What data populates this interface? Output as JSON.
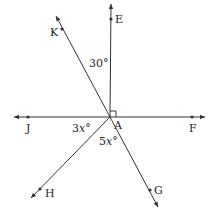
{
  "diagram": {
    "type": "geometry-angles",
    "vertex": {
      "label": "A",
      "x": 110,
      "y": 117
    },
    "rays": [
      {
        "name": "ray-AE",
        "end": [
          111,
          4
        ],
        "point": {
          "label": "E",
          "x": 111,
          "y": 19,
          "lx": 115,
          "ly": 23
        }
      },
      {
        "name": "ray-AK",
        "end": [
          56,
          16
        ],
        "point": {
          "label": "K",
          "x": 62,
          "y": 29,
          "lx": 50,
          "ly": 36
        }
      },
      {
        "name": "ray-AJ",
        "end": [
          14,
          117
        ],
        "point": {
          "label": "J",
          "x": 28,
          "y": 117,
          "lx": 26,
          "ly": 132
        }
      },
      {
        "name": "ray-AF",
        "end": [
          205,
          117
        ],
        "point": {
          "label": "F",
          "x": 192,
          "y": 117,
          "lx": 189,
          "ly": 132
        }
      },
      {
        "name": "ray-AH",
        "end": [
          31,
          198
        ],
        "point": {
          "label": "H",
          "x": 40,
          "y": 189,
          "lx": 45,
          "ly": 197
        }
      },
      {
        "name": "ray-AG",
        "end": [
          158,
          207
        ],
        "point": {
          "label": "G",
          "x": 150,
          "y": 190,
          "lx": 154,
          "ly": 194
        }
      }
    ],
    "angle_labels": [
      {
        "name": "angle-KAE",
        "text": "30°",
        "x": 89,
        "y": 67
      },
      {
        "name": "angle-JAH",
        "text": "3x°",
        "x": 72,
        "y": 132
      },
      {
        "name": "angle-HAG",
        "text": "5x°",
        "x": 99,
        "y": 145
      }
    ],
    "vertex_label": {
      "text": "A",
      "x": 114,
      "y": 129
    },
    "right_angle_mark": {
      "x": 110,
      "y": 111,
      "size": 6
    },
    "colors": {
      "line": "#333333",
      "text": "#222222",
      "background": "#ffffff"
    }
  }
}
